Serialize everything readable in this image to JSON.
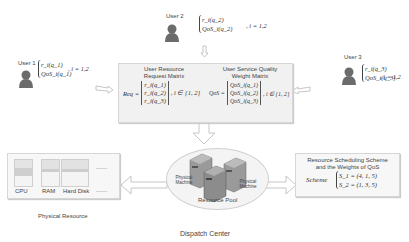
{
  "users": [
    {
      "label": "User 1",
      "formula_line1": "r_i(q_1)",
      "formula_line2": "QoS_i(q_1)",
      "range": ", i = 1,2"
    },
    {
      "label": "User 2",
      "formula_line1": "r_i(q_2)",
      "formula_line2": "QoS_i(q_2)",
      "range": ", i = 1,2"
    },
    {
      "label": "User 3",
      "formula_line1": "r_i(q_3)",
      "formula_line2": "QoS_i(q_3)",
      "range": ", i = 1,2"
    }
  ],
  "request_matrix": {
    "title_line1": "User Resource",
    "title_line2": "Request Matrix",
    "lhs": "Req =",
    "rows": [
      "r_i(q_1)",
      "r_i(q_2)",
      "r_i(q_3)"
    ],
    "range": ", i ∈ {1, 2}"
  },
  "qos_matrix": {
    "title_line1": "User Service Quality",
    "title_line2": "Weight Matrix",
    "lhs": "QoS =",
    "rows": [
      "QoS_i(q_1)",
      "QoS_i(q_2)",
      "QoS_i(q_3)"
    ],
    "range": ", i ∈ {1, 2}"
  },
  "physical_resource": {
    "caption": "Physical Resource",
    "columns": [
      "CPU",
      "RAM",
      "Hard Disk",
      "........"
    ],
    "ellipsis_top": "........"
  },
  "resource_pool": {
    "caption": "Resource Pool",
    "machine_label_left": "Physical Machine",
    "machine_label_right": "Physical Machine"
  },
  "scheme": {
    "title_line1": "Resource Scheduling Scheme",
    "title_line2": "and the Weights of  QoS",
    "lhs": "Scheme",
    "rows": [
      "S_1 = (4, 1, 5)",
      "S_2 = (1, 3, 5)"
    ]
  },
  "footer": {
    "caption": "Dispatch Center"
  },
  "colors": {
    "user_icon": "#6b6b6b",
    "panel_bg": "#f1f1f1",
    "arrow": "#c8c8c8",
    "server": "#8a8a8a"
  }
}
